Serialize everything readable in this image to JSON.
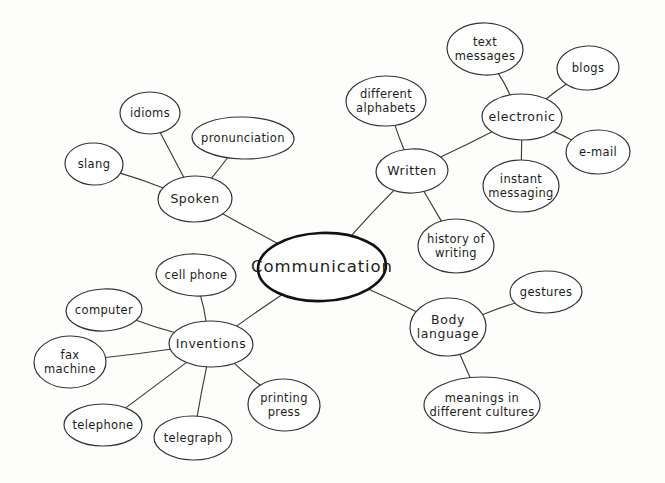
{
  "diagram": {
    "title": "Communication",
    "type": "mind-map",
    "style": "hand-drawn",
    "background_color": "#fdfdfc",
    "line_color": "#3c3c3c",
    "text_color": "#1d1d1d"
  },
  "nodes": [
    {
      "id": "communication",
      "label": "Communication",
      "level": "central",
      "cx": 322,
      "cy": 267,
      "rx": 64,
      "ry": 34
    },
    {
      "id": "spoken",
      "label": "Spoken",
      "level": "branch",
      "cx": 195,
      "cy": 199,
      "rx": 37,
      "ry": 23
    },
    {
      "id": "idioms",
      "label": "idioms",
      "level": "leaf",
      "cx": 150,
      "cy": 113,
      "rx": 30,
      "ry": 21
    },
    {
      "id": "pronunciation",
      "label": "pronunciation",
      "level": "leaf",
      "cx": 243,
      "cy": 138,
      "rx": 51,
      "ry": 21
    },
    {
      "id": "slang",
      "label": "slang",
      "level": "leaf",
      "cx": 94,
      "cy": 164,
      "rx": 29,
      "ry": 21
    },
    {
      "id": "written",
      "label": "Written",
      "level": "branch",
      "cx": 412,
      "cy": 171,
      "rx": 36,
      "ry": 22
    },
    {
      "id": "different-alphabets",
      "label": "different\nalphabets",
      "level": "leaf",
      "cx": 386,
      "cy": 101,
      "rx": 40,
      "ry": 25
    },
    {
      "id": "history-of-writing",
      "label": "history of\nwriting",
      "level": "leaf",
      "cx": 456,
      "cy": 246,
      "rx": 38,
      "ry": 27
    },
    {
      "id": "electronic",
      "label": "electronic",
      "level": "branch",
      "cx": 522,
      "cy": 117,
      "rx": 40,
      "ry": 23
    },
    {
      "id": "text-messages",
      "label": "text\nmessages",
      "level": "leaf",
      "cx": 485,
      "cy": 49,
      "rx": 38,
      "ry": 26
    },
    {
      "id": "blogs",
      "label": "blogs",
      "level": "leaf",
      "cx": 588,
      "cy": 68,
      "rx": 31,
      "ry": 22
    },
    {
      "id": "e-mail",
      "label": "e-mail",
      "level": "leaf",
      "cx": 598,
      "cy": 152,
      "rx": 32,
      "ry": 22
    },
    {
      "id": "instant-messaging",
      "label": "instant\nmessaging",
      "level": "leaf",
      "cx": 521,
      "cy": 186,
      "rx": 38,
      "ry": 26
    },
    {
      "id": "inventions",
      "label": "Inventions",
      "level": "branch",
      "cx": 211,
      "cy": 344,
      "rx": 42,
      "ry": 23
    },
    {
      "id": "cell-phone",
      "label": "cell phone",
      "level": "leaf",
      "cx": 196,
      "cy": 275,
      "rx": 40,
      "ry": 21
    },
    {
      "id": "computer",
      "label": "computer",
      "level": "leaf",
      "cx": 104,
      "cy": 310,
      "rx": 38,
      "ry": 21
    },
    {
      "id": "fax-machine",
      "label": "fax\nmachine",
      "level": "leaf",
      "cx": 70,
      "cy": 362,
      "rx": 36,
      "ry": 26
    },
    {
      "id": "telephone",
      "label": "telephone",
      "level": "leaf",
      "cx": 103,
      "cy": 425,
      "rx": 39,
      "ry": 21
    },
    {
      "id": "telegraph",
      "label": "telegraph",
      "level": "leaf",
      "cx": 193,
      "cy": 438,
      "rx": 39,
      "ry": 22
    },
    {
      "id": "printing-press",
      "label": "printing\npress",
      "level": "leaf",
      "cx": 284,
      "cy": 405,
      "rx": 36,
      "ry": 26
    },
    {
      "id": "body-language",
      "label": "Body\nlanguage",
      "level": "branch",
      "cx": 448,
      "cy": 327,
      "rx": 38,
      "ry": 29
    },
    {
      "id": "gestures",
      "label": "gestures",
      "level": "leaf",
      "cx": 546,
      "cy": 292,
      "rx": 36,
      "ry": 21
    },
    {
      "id": "meanings-in-different-cultures",
      "label": "meanings in\ndifferent cultures",
      "level": "leaf",
      "cx": 482,
      "cy": 405,
      "rx": 58,
      "ry": 28
    }
  ],
  "edges": [
    {
      "from": "communication",
      "to": "spoken"
    },
    {
      "from": "spoken",
      "to": "idioms"
    },
    {
      "from": "spoken",
      "to": "pronunciation"
    },
    {
      "from": "spoken",
      "to": "slang"
    },
    {
      "from": "communication",
      "to": "written"
    },
    {
      "from": "written",
      "to": "different-alphabets"
    },
    {
      "from": "written",
      "to": "history-of-writing"
    },
    {
      "from": "written",
      "to": "electronic"
    },
    {
      "from": "electronic",
      "to": "text-messages"
    },
    {
      "from": "electronic",
      "to": "blogs"
    },
    {
      "from": "electronic",
      "to": "e-mail"
    },
    {
      "from": "electronic",
      "to": "instant-messaging"
    },
    {
      "from": "communication",
      "to": "inventions"
    },
    {
      "from": "inventions",
      "to": "cell-phone"
    },
    {
      "from": "inventions",
      "to": "computer"
    },
    {
      "from": "inventions",
      "to": "fax-machine"
    },
    {
      "from": "inventions",
      "to": "telephone"
    },
    {
      "from": "inventions",
      "to": "telegraph"
    },
    {
      "from": "inventions",
      "to": "printing-press"
    },
    {
      "from": "communication",
      "to": "body-language"
    },
    {
      "from": "body-language",
      "to": "gestures"
    },
    {
      "from": "body-language",
      "to": "meanings-in-different-cultures"
    }
  ]
}
